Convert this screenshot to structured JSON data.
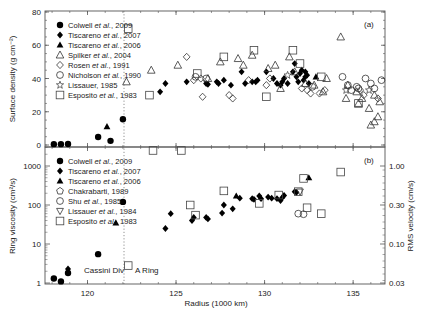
{
  "figure": {
    "xlabel": "Radius (1000 km)",
    "x_ticks": [
      "120",
      "125",
      "130",
      "135"
    ],
    "annotations": {
      "cassini_div": "Cassini Div",
      "a_ring": "A Ring"
    }
  },
  "chart_data": [
    {
      "panel": "a",
      "panel_label": "(a)",
      "type": "scatter",
      "title": "",
      "xlabel": "Radius (1000 km)",
      "ylabel": "Surface density (g cm⁻²)",
      "xlim": [
        117.6,
        136.8
      ],
      "ylim": [
        -5,
        80
      ],
      "y_ticks": [
        "0",
        "20",
        "40",
        "60",
        "80"
      ],
      "grid": false,
      "legend_position": "upper-left",
      "vline_x": 122.0,
      "series": [
        {
          "name": "Colwell et al., 2009",
          "marker": "filled-circle",
          "points": [
            [
              118.1,
              0.5
            ],
            [
              118.5,
              0.5
            ],
            [
              118.9,
              0.6
            ],
            [
              120.6,
              4.8
            ],
            [
              121.3,
              2.5
            ],
            [
              122.0,
              15.5
            ]
          ]
        },
        {
          "name": "Tiscareno et al., 2007",
          "marker": "filled-diamond",
          "points": [
            [
              124.1,
              32
            ],
            [
              124.4,
              37
            ],
            [
              125.6,
              38
            ],
            [
              126.7,
              37
            ],
            [
              126.8,
              36.5
            ],
            [
              127.3,
              38
            ],
            [
              127.4,
              37
            ],
            [
              127.7,
              39
            ],
            [
              128.1,
              36
            ],
            [
              128.7,
              44
            ],
            [
              128.9,
              37
            ],
            [
              129.3,
              38
            ],
            [
              129.5,
              38
            ],
            [
              129.6,
              39
            ],
            [
              130.1,
              44
            ],
            [
              130.5,
              40
            ],
            [
              130.7,
              37
            ],
            [
              130.9,
              36
            ],
            [
              131.0,
              38
            ],
            [
              131.1,
              40
            ],
            [
              131.3,
              37
            ],
            [
              131.6,
              44
            ],
            [
              131.7,
              49
            ],
            [
              131.8,
              41
            ],
            [
              131.9,
              38
            ],
            [
              132.0,
              43
            ],
            [
              132.1,
              45
            ],
            [
              132.2,
              39
            ],
            [
              132.3,
              41
            ],
            [
              132.4,
              42
            ],
            [
              132.5,
              37
            ],
            [
              132.3,
              44
            ]
          ]
        },
        {
          "name": "Tiscareno et al., 2006",
          "marker": "filled-triangle",
          "points": [
            [
              121.1,
              11
            ],
            [
              132.9,
              41
            ]
          ]
        },
        {
          "name": "Spilker et al., 2004",
          "marker": "open-triangle",
          "points": [
            [
              122.2,
              38
            ],
            [
              123.6,
              45
            ],
            [
              125.1,
              48
            ],
            [
              126.8,
              40
            ],
            [
              127.5,
              50
            ],
            [
              128.5,
              52
            ],
            [
              128.8,
              48
            ],
            [
              129.3,
              54
            ],
            [
              130.2,
              46
            ],
            [
              130.6,
              48
            ],
            [
              130.9,
              34
            ],
            [
              131.4,
              53
            ],
            [
              131.7,
              44
            ],
            [
              132.3,
              37
            ],
            [
              132.8,
              36
            ],
            [
              133.3,
              32
            ],
            [
              133.5,
              40
            ],
            [
              134.3,
              65
            ],
            [
              134.6,
              28
            ],
            [
              134.7,
              36
            ],
            [
              135.2,
              32
            ],
            [
              135.3,
              25
            ],
            [
              135.5,
              28
            ],
            [
              135.9,
              22
            ],
            [
              136.2,
              30
            ],
            [
              136.5,
              26
            ],
            [
              136.4,
              17
            ],
            [
              136.2,
              14
            ],
            [
              136.0,
              12
            ]
          ]
        },
        {
          "name": "Rosen et al., 1991",
          "marker": "open-diamond",
          "points": [
            [
              125.6,
              53
            ],
            [
              126.0,
              39
            ],
            [
              126.4,
              40
            ],
            [
              126.5,
              29
            ],
            [
              128.0,
              30
            ],
            [
              128.2,
              28
            ],
            [
              129.1,
              39
            ],
            [
              130.1,
              36
            ],
            [
              130.3,
              40
            ],
            [
              132.1,
              34
            ],
            [
              132.4,
              33
            ],
            [
              132.6,
              31
            ],
            [
              133.1,
              31
            ],
            [
              133.4,
              33
            ],
            [
              135.4,
              33
            ],
            [
              135.6,
              30
            ],
            [
              136.4,
              28
            ]
          ]
        },
        {
          "name": "Nicholson et al., 1990",
          "marker": "open-circle",
          "points": [
            [
              126.1,
              41
            ],
            [
              126.7,
              40
            ],
            [
              132.7,
              35
            ],
            [
              134.4,
              41
            ],
            [
              134.7,
              36
            ],
            [
              134.9,
              33
            ],
            [
              135.2,
              35
            ],
            [
              135.3,
              34
            ],
            [
              135.7,
              40
            ],
            [
              136.0,
              37
            ],
            [
              136.2,
              34
            ],
            [
              136.6,
              39
            ]
          ]
        },
        {
          "name": "Lissauer, 1985",
          "marker": "open-star",
          "points": [
            [
              131.3,
              42
            ],
            [
              134.6,
              33
            ],
            [
              135.9,
              33
            ]
          ]
        },
        {
          "name": "Esposito et al., 1983",
          "marker": "open-square",
          "points": [
            [
              122.3,
              70
            ],
            [
              123.5,
              30
            ],
            [
              126.2,
              43
            ],
            [
              127.7,
              53
            ],
            [
              129.4,
              57
            ],
            [
              130.1,
              29
            ],
            [
              131.6,
              57
            ],
            [
              132.0,
              49
            ],
            [
              133.2,
              41
            ],
            [
              135.3,
              25
            ]
          ]
        }
      ]
    },
    {
      "panel": "b",
      "panel_label": "(b)",
      "type": "scatter",
      "title": "",
      "xlabel": "Radius (1000 km)",
      "ylabel": "Ring viscosity (cm²/s)",
      "ylabel_right": "RMS velocity (cm/s)",
      "xlim": [
        117.6,
        136.8
      ],
      "ylim_log": [
        0.8,
        3000
      ],
      "y_ticks": [
        "1",
        "10",
        "100",
        "1000"
      ],
      "y_ticks_right": [
        "0.03",
        "0.10",
        "0.30",
        "1.00"
      ],
      "yscale": "log",
      "grid": false,
      "legend_position": "upper-left",
      "vline_x": 122.0,
      "series": [
        {
          "name": "Colwell et al., 2009",
          "marker": "filled-circle",
          "points": [
            [
              118.1,
              1.3
            ],
            [
              118.5,
              1.1
            ],
            [
              118.9,
              1.8
            ],
            [
              120.6,
              5.5
            ],
            [
              122.0,
              120
            ]
          ]
        },
        {
          "name": "Tiscareno et al., 2007",
          "marker": "filled-diamond",
          "points": [
            [
              118.9,
              2.3
            ],
            [
              124.4,
              25
            ],
            [
              124.7,
              60
            ],
            [
              125.9,
              40
            ],
            [
              126.0,
              48
            ],
            [
              126.7,
              48
            ],
            [
              126.8,
              44
            ],
            [
              127.6,
              62
            ],
            [
              127.7,
              100
            ],
            [
              128.2,
              80
            ],
            [
              128.6,
              150
            ],
            [
              129.3,
              145
            ],
            [
              129.4,
              140
            ],
            [
              129.7,
              170
            ],
            [
              129.8,
              145
            ],
            [
              130.2,
              160
            ],
            [
              130.4,
              150
            ],
            [
              130.7,
              145
            ],
            [
              130.9,
              130
            ],
            [
              131.0,
              155
            ],
            [
              131.1,
              175
            ],
            [
              131.7,
              220
            ],
            [
              131.8,
              210
            ]
          ]
        },
        {
          "name": "Tiscareno et al., 2006",
          "marker": "filled-triangle",
          "points": [
            [
              121.6,
              35
            ],
            [
              128.4,
              170
            ],
            [
              132.5,
              500
            ]
          ]
        },
        {
          "name": "Chakrabarti, 1989",
          "marker": "open-pentagon",
          "points": []
        },
        {
          "name": "Shu et al., 1985",
          "marker": "open-circle",
          "points": [
            [
              131.9,
              60
            ],
            [
              132.2,
              58
            ]
          ]
        },
        {
          "name": "Lissauer et al., 1984",
          "marker": "open-down-triangle",
          "points": [
            [
              132.0,
              220
            ]
          ]
        },
        {
          "name": "Esposito et al., 1983",
          "marker": "open-square",
          "points": [
            [
              122.3,
              2.8
            ],
            [
              123.7,
              2500
            ],
            [
              125.3,
              2500
            ],
            [
              125.8,
              100
            ],
            [
              126.1,
              55
            ],
            [
              127.7,
              230
            ],
            [
              129.7,
              110
            ],
            [
              130.8,
              180
            ],
            [
              131.9,
              220
            ],
            [
              132.2,
              480
            ],
            [
              132.4,
              85
            ],
            [
              133.2,
              60
            ],
            [
              134.3,
              700
            ]
          ]
        }
      ]
    }
  ]
}
